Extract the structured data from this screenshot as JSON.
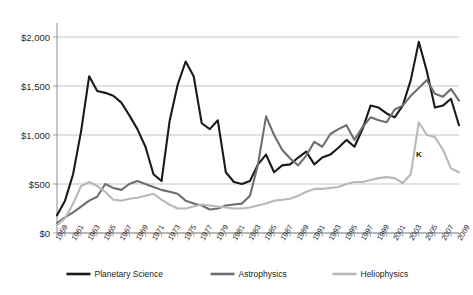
{
  "chart_data": {
    "type": "line",
    "title": "",
    "subtitle": "",
    "xlabel": "",
    "ylabel": "",
    "ylim": [
      0,
      2000
    ],
    "ytick_values": [
      0,
      500,
      1000,
      1500,
      2000
    ],
    "ytick_labels": [
      "$0",
      "$500",
      "$1,000",
      "$1,500",
      "$2,000"
    ],
    "grid": true,
    "legend_position": "bottom",
    "x": [
      1959,
      1960,
      1961,
      1962,
      1963,
      1964,
      1965,
      1966,
      1967,
      1968,
      1969,
      1970,
      1971,
      1972,
      1973,
      1974,
      1975,
      1976,
      1977,
      1978,
      1979,
      1980,
      1981,
      1982,
      1983,
      1984,
      1985,
      1986,
      1987,
      1988,
      1989,
      1990,
      1991,
      1992,
      1993,
      1994,
      1995,
      1996,
      1997,
      1998,
      1999,
      2000,
      2001,
      2002,
      2003,
      2004,
      2005,
      2006,
      2007,
      2008,
      2009
    ],
    "xtick_labels": [
      "1959",
      "1961",
      "1963",
      "1965",
      "1967",
      "1969",
      "1971",
      "1973",
      "1975",
      "1977",
      "1979",
      "1981",
      "1983",
      "1985",
      "1987",
      "1989",
      "1991",
      "1993",
      "1995",
      "1997",
      "1999",
      "2001",
      "2003",
      "2005",
      "2007",
      "2009"
    ],
    "series": [
      {
        "name": "Planetary Science",
        "color": "#1a1a1a",
        "width": 2.1,
        "values": [
          180,
          330,
          600,
          1040,
          1600,
          1450,
          1430,
          1400,
          1330,
          1200,
          1060,
          880,
          600,
          530,
          1140,
          1510,
          1750,
          1600,
          1120,
          1060,
          1150,
          620,
          520,
          500,
          530,
          700,
          800,
          620,
          690,
          700,
          770,
          830,
          700,
          770,
          800,
          870,
          950,
          880,
          1060,
          1300,
          1280,
          1220,
          1180,
          1300,
          1560,
          1950,
          1650,
          1280,
          1300,
          1370,
          1100
        ]
      },
      {
        "name": "Astrophysics",
        "color": "#6e6e6e",
        "width": 2.1,
        "values": [
          100,
          160,
          210,
          270,
          330,
          370,
          500,
          460,
          440,
          500,
          530,
          500,
          470,
          440,
          420,
          400,
          330,
          300,
          280,
          240,
          250,
          280,
          290,
          300,
          380,
          700,
          1190,
          1000,
          850,
          760,
          690,
          790,
          930,
          880,
          1010,
          1060,
          1100,
          950,
          1080,
          1180,
          1150,
          1130,
          1260,
          1300,
          1400,
          1480,
          1560,
          1420,
          1390,
          1470,
          1350
        ]
      },
      {
        "name": "Heliophysics",
        "color": "#b8b8b8",
        "width": 2.1,
        "values": [
          80,
          150,
          300,
          480,
          520,
          480,
          420,
          340,
          330,
          350,
          360,
          380,
          400,
          340,
          290,
          250,
          250,
          270,
          290,
          280,
          270,
          260,
          250,
          250,
          260,
          280,
          300,
          330,
          340,
          350,
          380,
          420,
          450,
          450,
          460,
          470,
          500,
          520,
          520,
          540,
          560,
          570,
          560,
          510,
          600,
          1130,
          1000,
          980,
          850,
          660,
          620
        ]
      }
    ],
    "annotations": [
      {
        "text": "K",
        "x": 2004,
        "y": 780
      }
    ]
  }
}
